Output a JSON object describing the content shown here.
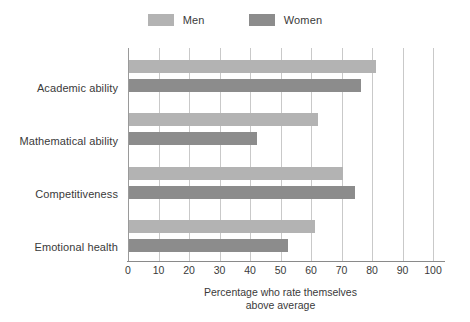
{
  "legend": {
    "position": "top-center",
    "items": [
      {
        "label": "Men",
        "color": "#b3b3b3",
        "swatch_icon": "legend-swatch-icon"
      },
      {
        "label": "Women",
        "color": "#8c8c8c",
        "swatch_icon": "legend-swatch-icon"
      }
    ]
  },
  "axis": {
    "ticks": [
      "0",
      "10",
      "20",
      "30",
      "40",
      "50",
      "60",
      "70",
      "80",
      "90",
      "100"
    ],
    "title_line1": "Percentage who rate themselves",
    "title_line2": "above average"
  },
  "categories": [
    "Academic ability",
    "Mathematical ability",
    "Competitiveness",
    "Emotional health"
  ],
  "chart_data": {
    "type": "bar",
    "orientation": "horizontal",
    "title": "",
    "xlabel": "Percentage who rate themselves above average",
    "ylabel": "",
    "xlim": [
      0,
      100
    ],
    "xticks": [
      0,
      10,
      20,
      30,
      40,
      50,
      60,
      70,
      80,
      90,
      100
    ],
    "grid": true,
    "grid_axis": "x",
    "legend": [
      "Men",
      "Women"
    ],
    "legend_position": "top-center",
    "categories": [
      "Academic ability",
      "Mathematical ability",
      "Competitiveness",
      "Emotional health"
    ],
    "series": [
      {
        "name": "Men",
        "color": "#b3b3b3",
        "values": [
          81,
          62,
          70,
          61
        ]
      },
      {
        "name": "Women",
        "color": "#8c8c8c",
        "values": [
          76,
          42,
          74,
          52
        ]
      }
    ]
  }
}
